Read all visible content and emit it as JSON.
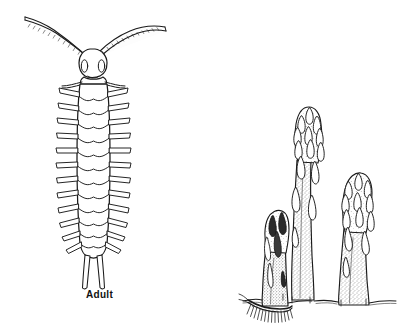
{
  "figure": {
    "domain": "Natural-Image",
    "kind": "scientific-line-illustration",
    "background_color": "#ffffff",
    "ink_color": "#1a1a1a",
    "width": 402,
    "height": 336,
    "panels": [
      {
        "id": "left-panel",
        "name": "adult-insect-illustration",
        "caption": "Adult",
        "subject": "garden symphylan / centipede-like adult, dorsal view"
      },
      {
        "id": "right-panel",
        "name": "asparagus-spears-illustration",
        "caption": "",
        "subject": "three asparagus spears emerging from soil with feeding damage"
      }
    ]
  },
  "left_panel": {
    "caption_label": "Adult",
    "anatomy": {
      "head_label": "head",
      "antennae_label": "antennae",
      "body_label": "segmented body",
      "legs_label": "lateral legs",
      "cerci_label": "cerci"
    },
    "counts": {
      "antennae": 2,
      "body_segments": 14,
      "leg_pairs": 12,
      "cerci": 2
    }
  },
  "right_panel": {
    "spears": [
      {
        "id": "spear-front-damaged",
        "label": "damaged spear",
        "height_rank": "short"
      },
      {
        "id": "spear-tall",
        "label": "tall spear",
        "height_rank": "tall"
      },
      {
        "id": "spear-right",
        "label": "right spear",
        "height_rank": "medium"
      }
    ],
    "soil_line_label": "soil line",
    "pest_label": "symphylan at soil line"
  }
}
